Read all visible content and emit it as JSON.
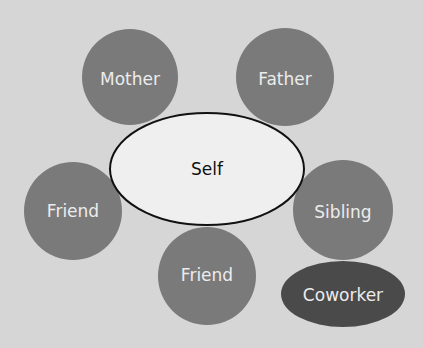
{
  "diagram": {
    "background": "#d6d6d6",
    "center": {
      "label": "Self",
      "fill": "#efefef",
      "stroke": "#111111"
    },
    "nodes": [
      {
        "label": "Mother",
        "fill": "#7a7a7a"
      },
      {
        "label": "Father",
        "fill": "#7a7a7a"
      },
      {
        "label": "Friend",
        "fill": "#7a7a7a"
      },
      {
        "label": "Sibling",
        "fill": "#7a7a7a"
      },
      {
        "label": "Friend",
        "fill": "#7a7a7a"
      },
      {
        "label": "Coworker",
        "fill": "#4a4a4a"
      }
    ]
  }
}
